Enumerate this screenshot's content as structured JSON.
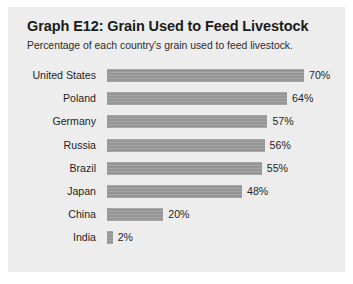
{
  "chart_data": {
    "type": "bar",
    "orientation": "horizontal",
    "title": "Graph E12: Grain Used to Feed Livestock",
    "subtitle": "Percentage of each country's grain used to feed livestock.",
    "xlabel": "",
    "ylabel": "",
    "xlim": [
      0,
      70
    ],
    "grid": false,
    "legend": null,
    "value_suffix": "%",
    "bar_color": "#9b9b9b",
    "background_color": "#ededed",
    "categories": [
      "United States",
      "Poland",
      "Germany",
      "Russia",
      "Brazil",
      "Japan",
      "China",
      "India"
    ],
    "values": [
      70,
      64,
      57,
      56,
      55,
      48,
      20,
      2
    ],
    "data_labels": [
      "70%",
      "64%",
      "57%",
      "56%",
      "55%",
      "48%",
      "20%",
      "2%"
    ],
    "points": [
      {
        "category": "United States",
        "value": 70,
        "label": "70%"
      },
      {
        "category": "Poland",
        "value": 64,
        "label": "64%"
      },
      {
        "category": "Germany",
        "value": 57,
        "label": "57%"
      },
      {
        "category": "Russia",
        "value": 56,
        "label": "56%"
      },
      {
        "category": "Brazil",
        "value": 55,
        "label": "55%"
      },
      {
        "category": "Japan",
        "value": 48,
        "label": "48%"
      },
      {
        "category": "China",
        "value": 20,
        "label": "20%"
      },
      {
        "category": "India",
        "value": 2,
        "label": "2%"
      }
    ]
  }
}
